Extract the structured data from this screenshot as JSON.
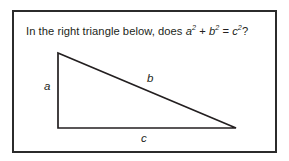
{
  "figure": {
    "prompt": {
      "lead": "In the right triangle below, does ",
      "var_a": "a",
      "exp_a": "2",
      "plus": " + ",
      "var_b": "b",
      "exp_b": "2",
      "equals": " = ",
      "var_c": "c",
      "exp_c": "2",
      "question_mark": "?",
      "full_text": "In the right triangle below, does a2 + b2 = c2?"
    },
    "colors": {
      "frame_stroke": "#2b2b2b",
      "triangle_stroke": "#231f20",
      "text": "#231f20",
      "background": "#ffffff"
    },
    "triangle": {
      "labels": {
        "leg_vertical": "a",
        "hypotenuse": "b",
        "leg_horizontal": "c"
      },
      "vertices": {
        "top_left": [
          58,
          53
        ],
        "bottom_left": [
          58,
          128
        ],
        "bottom_right": [
          236,
          128
        ]
      }
    }
  }
}
